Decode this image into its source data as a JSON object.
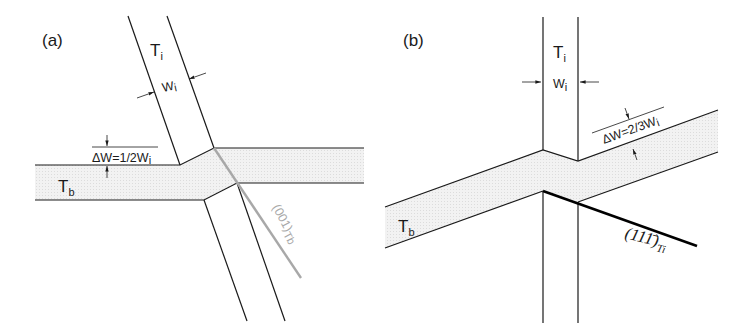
{
  "figure": {
    "panels": [
      {
        "id": "a",
        "label": "(a)",
        "twin_incident": {
          "symbol": "T",
          "subscript": "i"
        },
        "width_label": {
          "symbol": "W",
          "subscript": "i"
        },
        "twin_boundary": {
          "symbol": "T",
          "subscript": "b"
        },
        "offset_label": "ΔW=1/2W",
        "offset_subscript": "i",
        "plane_label": "(001)",
        "plane_subscript": "Tb",
        "plane_line_color": "#a8a8a8"
      },
      {
        "id": "b",
        "label": "(b)",
        "twin_incident": {
          "symbol": "T",
          "subscript": "i"
        },
        "width_label": {
          "symbol": "W",
          "subscript": "i"
        },
        "twin_boundary": {
          "symbol": "T",
          "subscript": "b"
        },
        "offset_label": "ΔW=2/3W",
        "offset_subscript": "i",
        "plane_label": "(11",
        "plane_bar_index": "1̄",
        "plane_close": ")",
        "plane_subscript": "Ti",
        "plane_line_color": "#000000"
      }
    ],
    "band_fill_color": "#eeeeee",
    "line_color": "#1a1a1a"
  }
}
